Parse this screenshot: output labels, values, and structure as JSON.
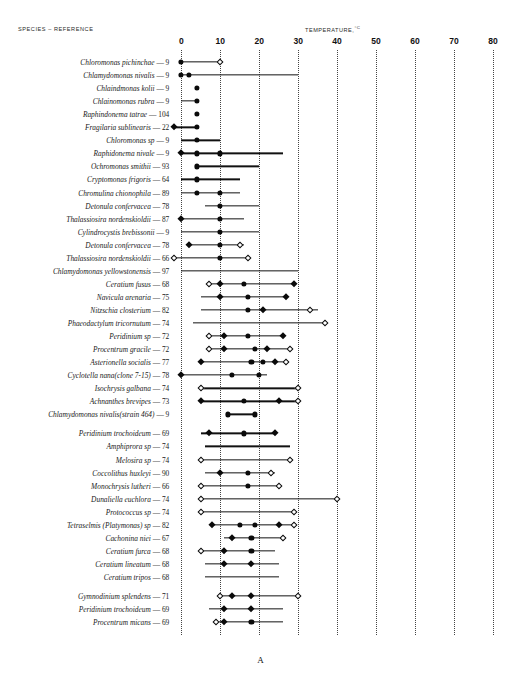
{
  "figure": {
    "species_header": "SPECIES  –  REFERENCE",
    "temperature_header": "TEMPERATURE,",
    "temperature_unit": "°C",
    "panel_letter": "A"
  },
  "chart_data": {
    "type": "range-dot-plot",
    "xlabel": "TEMPERATURE, °C",
    "ylabel": "SPECIES – REFERENCE",
    "xlim": [
      0,
      80
    ],
    "xticks": [
      0,
      10,
      20,
      30,
      40,
      50,
      60,
      70,
      80
    ],
    "xticklabels": [
      "0",
      "10",
      "20",
      "30",
      "40",
      "50",
      "60",
      "70",
      "80"
    ],
    "grid": "vertical dotted at each tick",
    "legend": [
      {
        "symbol": "filled-circle",
        "meaning": "optimum / measured point"
      },
      {
        "symbol": "filled-diamond",
        "meaning": "measured point"
      },
      {
        "symbol": "open-diamond",
        "meaning": "limit point"
      }
    ],
    "marker_types": [
      "filled-circle",
      "filled-diamond",
      "open-diamond"
    ],
    "rows": [
      {
        "species": "Chloromonas pichinchae",
        "reference": "9",
        "range": [
          0.0,
          10.0
        ],
        "markers": [
          {
            "x": 0.0,
            "type": "filled-circle"
          },
          {
            "x": 10.0,
            "type": "open-diamond"
          }
        ]
      },
      {
        "species": "Chlamydomonas nivalis",
        "reference": "9",
        "range": [
          0.0,
          30.0
        ],
        "markers": [
          {
            "x": 0.0,
            "type": "filled-circle"
          },
          {
            "x": 2.0,
            "type": "filled-circle"
          }
        ]
      },
      {
        "species": "Chlaindmonas kolii",
        "reference": "9",
        "range": null,
        "markers": [
          {
            "x": 4.0,
            "type": "filled-circle"
          }
        ]
      },
      {
        "species": "Chlainomonas rubra",
        "reference": "9",
        "range": [
          0.0,
          4.0
        ],
        "markers": [
          {
            "x": 4.0,
            "type": "filled-circle"
          }
        ]
      },
      {
        "species": "Raphindonema tatrae",
        "reference": "104",
        "range": null,
        "markers": [
          {
            "x": 4.0,
            "type": "filled-circle"
          }
        ]
      },
      {
        "species": "Fragilaria sublinearis",
        "reference": "22",
        "range": [
          -1.8,
          4.0
        ],
        "markers": [
          {
            "x": -1.8,
            "type": "filled-diamond"
          },
          {
            "x": 4.0,
            "type": "filled-circle"
          }
        ]
      },
      {
        "species": "Chloromonas sp",
        "reference": "9",
        "range": [
          0.0,
          10.0
        ],
        "markers": [
          {
            "x": 4.0,
            "type": "filled-circle"
          }
        ]
      },
      {
        "species": "Raphidonema nivale",
        "reference": "9",
        "range": [
          0.0,
          26.0
        ],
        "markers": [
          {
            "x": 0.0,
            "type": "filled-diamond"
          },
          {
            "x": 4.0,
            "type": "filled-circle"
          },
          {
            "x": 10.0,
            "type": "filled-circle"
          }
        ]
      },
      {
        "species": "Ochromonas smithii",
        "reference": "93",
        "range": [
          4.0,
          20.0
        ],
        "markers": [
          {
            "x": 4.0,
            "type": "filled-circle"
          }
        ]
      },
      {
        "species": "Cryptomonas frigoris",
        "reference": "64",
        "range": [
          0.0,
          15.0
        ],
        "markers": [
          {
            "x": 4.0,
            "type": "filled-circle"
          }
        ]
      },
      {
        "species": "Chromulina chionophila",
        "reference": "89",
        "range": [
          0.0,
          15.0
        ],
        "markers": [
          {
            "x": 4.0,
            "type": "filled-circle"
          },
          {
            "x": 10.0,
            "type": "filled-circle"
          }
        ]
      },
      {
        "species": "Detonula confervacea",
        "reference": "78",
        "range": [
          6.0,
          20.0
        ],
        "markers": [
          {
            "x": 10.0,
            "type": "filled-circle"
          }
        ]
      },
      {
        "species": "Thalassiosira nordenskioldii",
        "reference": "87",
        "range": [
          0.0,
          16.0
        ],
        "markers": [
          {
            "x": 0.0,
            "type": "filled-diamond"
          },
          {
            "x": 10.0,
            "type": "filled-circle"
          }
        ]
      },
      {
        "species": "Cylindrocystis brebissonii",
        "reference": "9",
        "range": [
          0.0,
          20.0
        ],
        "markers": [
          {
            "x": 10.0,
            "type": "filled-circle"
          }
        ]
      },
      {
        "species": "Detonula confervacea",
        "reference": "78",
        "range": [
          2.0,
          16.0
        ],
        "markers": [
          {
            "x": 2.0,
            "type": "filled-diamond"
          },
          {
            "x": 10.0,
            "type": "filled-circle"
          },
          {
            "x": 15.0,
            "type": "open-diamond"
          }
        ]
      },
      {
        "species": "Thalassiosira nordenskioldii",
        "reference": "66",
        "range": [
          -1.8,
          17.0
        ],
        "markers": [
          {
            "x": -1.8,
            "type": "open-diamond"
          },
          {
            "x": 10.0,
            "type": "filled-circle"
          },
          {
            "x": 17.0,
            "type": "open-diamond"
          }
        ]
      },
      {
        "species": "Chlamydomonas yellowstonensis",
        "reference": "97",
        "range": [
          0.0,
          30.0
        ],
        "markers": []
      },
      {
        "species": "Ceratium fusus",
        "reference": "68",
        "range": [
          7.0,
          29.0
        ],
        "markers": [
          {
            "x": 7.0,
            "type": "open-diamond"
          },
          {
            "x": 10.0,
            "type": "filled-diamond"
          },
          {
            "x": 16.0,
            "type": "filled-circle"
          },
          {
            "x": 29.0,
            "type": "filled-diamond"
          }
        ]
      },
      {
        "species": "Navicula arenaria",
        "reference": "75",
        "range": [
          5.0,
          27.0
        ],
        "markers": [
          {
            "x": 10.0,
            "type": "filled-diamond"
          },
          {
            "x": 17.0,
            "type": "filled-circle"
          },
          {
            "x": 27.0,
            "type": "filled-diamond"
          }
        ]
      },
      {
        "species": "Nitzschia closterium",
        "reference": "82",
        "range": [
          5.0,
          35.0
        ],
        "markers": [
          {
            "x": 17.0,
            "type": "filled-circle"
          },
          {
            "x": 21.0,
            "type": "filled-diamond"
          },
          {
            "x": 33.0,
            "type": "open-diamond"
          }
        ]
      },
      {
        "species": "Phaeodactylum tricornutum",
        "reference": "74",
        "range": [
          3.0,
          37.0
        ],
        "markers": [
          {
            "x": 37.0,
            "type": "open-diamond"
          }
        ]
      },
      {
        "species": "Peridinium sp",
        "reference": "72",
        "range": [
          7.0,
          26.0
        ],
        "markers": [
          {
            "x": 7.0,
            "type": "open-diamond"
          },
          {
            "x": 11.0,
            "type": "filled-diamond"
          },
          {
            "x": 17.0,
            "type": "filled-circle"
          },
          {
            "x": 26.0,
            "type": "filled-diamond"
          }
        ]
      },
      {
        "species": "Procentrum gracile",
        "reference": "72",
        "range": [
          7.0,
          28.0
        ],
        "markers": [
          {
            "x": 7.0,
            "type": "open-diamond"
          },
          {
            "x": 11.0,
            "type": "filled-diamond"
          },
          {
            "x": 19.0,
            "type": "filled-circle"
          },
          {
            "x": 22.0,
            "type": "filled-diamond"
          },
          {
            "x": 28.0,
            "type": "open-diamond"
          }
        ]
      },
      {
        "species": "Asterionella socialis",
        "reference": "77",
        "range": [
          5.0,
          27.0
        ],
        "markers": [
          {
            "x": 5.0,
            "type": "filled-diamond"
          },
          {
            "x": 18.0,
            "type": "filled-circle"
          },
          {
            "x": 21.0,
            "type": "filled-circle"
          },
          {
            "x": 24.0,
            "type": "filled-diamond"
          },
          {
            "x": 27.0,
            "type": "open-diamond"
          }
        ]
      },
      {
        "species": "Cyclotella nana(clone 7-15)",
        "reference": "78",
        "range": [
          0.0,
          22.0
        ],
        "markers": [
          {
            "x": 0.0,
            "type": "filled-diamond"
          },
          {
            "x": 13.0,
            "type": "filled-circle"
          },
          {
            "x": 20.0,
            "type": "filled-circle"
          }
        ]
      },
      {
        "species": "Isochrysis galbana",
        "reference": "74",
        "range": [
          5.0,
          30.0
        ],
        "markers": [
          {
            "x": 5.0,
            "type": "open-diamond"
          },
          {
            "x": 30.0,
            "type": "open-diamond"
          }
        ]
      },
      {
        "species": "Achnanthes brevipes",
        "reference": "73",
        "range": [
          5.0,
          30.0
        ],
        "markers": [
          {
            "x": 5.0,
            "type": "filled-diamond"
          },
          {
            "x": 16.0,
            "type": "filled-circle"
          },
          {
            "x": 25.0,
            "type": "filled-diamond"
          },
          {
            "x": 30.0,
            "type": "open-diamond"
          }
        ]
      },
      {
        "species": "Chlamydomonas nivalis(strain 464)",
        "reference": "9",
        "range": [
          12.0,
          19.0
        ],
        "markers": [
          {
            "x": 12.0,
            "type": "filled-circle"
          },
          {
            "x": 19.0,
            "type": "filled-circle"
          }
        ]
      },
      {
        "species": "Peridinium trochoideum",
        "reference": "69",
        "range": [
          5.0,
          24.0
        ],
        "markers": [
          {
            "x": 7.0,
            "type": "filled-diamond"
          },
          {
            "x": 16.0,
            "type": "filled-circle"
          },
          {
            "x": 24.0,
            "type": "filled-diamond"
          }
        ]
      },
      {
        "species": "Amphiprora sp",
        "reference": "74",
        "range": [
          6.0,
          28.0
        ],
        "markers": []
      },
      {
        "species": "Melosira sp",
        "reference": "74",
        "range": [
          5.0,
          28.0
        ],
        "markers": [
          {
            "x": 5.0,
            "type": "open-diamond"
          },
          {
            "x": 28.0,
            "type": "open-diamond"
          }
        ]
      },
      {
        "species": "Coccolithus huxleyi",
        "reference": "90",
        "range": [
          6.0,
          24.0
        ],
        "markers": [
          {
            "x": 10.0,
            "type": "filled-diamond"
          },
          {
            "x": 17.0,
            "type": "filled-circle"
          },
          {
            "x": 23.0,
            "type": "open-diamond"
          }
        ]
      },
      {
        "species": "Monochrysis lutheri",
        "reference": "66",
        "range": [
          5.0,
          25.0
        ],
        "markers": [
          {
            "x": 5.0,
            "type": "open-diamond"
          },
          {
            "x": 17.0,
            "type": "filled-circle"
          },
          {
            "x": 25.0,
            "type": "open-diamond"
          }
        ]
      },
      {
        "species": "Dunaliella euchlora",
        "reference": "74",
        "range": [
          5.0,
          40.0
        ],
        "markers": [
          {
            "x": 5.0,
            "type": "open-diamond"
          },
          {
            "x": 40.0,
            "type": "open-diamond"
          }
        ]
      },
      {
        "species": "Protococcus sp",
        "reference": "74",
        "range": [
          5.0,
          29.0
        ],
        "markers": [
          {
            "x": 5.0,
            "type": "open-diamond"
          },
          {
            "x": 29.0,
            "type": "open-diamond"
          }
        ]
      },
      {
        "species": "Tetraselmis (Platymonas) sp",
        "reference": "82",
        "range": [
          8.0,
          29.0
        ],
        "markers": [
          {
            "x": 8.0,
            "type": "filled-diamond"
          },
          {
            "x": 15.0,
            "type": "filled-circle"
          },
          {
            "x": 19.0,
            "type": "filled-circle"
          },
          {
            "x": 25.0,
            "type": "filled-diamond"
          },
          {
            "x": 29.0,
            "type": "open-diamond"
          }
        ]
      },
      {
        "species": "Cachonina niei",
        "reference": "67",
        "range": [
          11.0,
          27.0
        ],
        "markers": [
          {
            "x": 13.0,
            "type": "filled-diamond"
          },
          {
            "x": 18.0,
            "type": "filled-circle"
          },
          {
            "x": 26.0,
            "type": "open-diamond"
          }
        ]
      },
      {
        "species": "Ceratium furca",
        "reference": "68",
        "range": [
          5.0,
          24.0
        ],
        "markers": [
          {
            "x": 5.0,
            "type": "open-diamond"
          },
          {
            "x": 11.0,
            "type": "filled-diamond"
          },
          {
            "x": 18.0,
            "type": "filled-circle"
          }
        ]
      },
      {
        "species": "Ceratium lineatum",
        "reference": "68",
        "range": [
          6.0,
          25.0
        ],
        "markers": [
          {
            "x": 11.0,
            "type": "filled-diamond"
          },
          {
            "x": 18.0,
            "type": "filled-diamond"
          }
        ]
      },
      {
        "species": "Ceratium tripos",
        "reference": "68",
        "range": [
          6.0,
          25.0
        ],
        "markers": []
      },
      {
        "species": "Gymnodinium splendens",
        "reference": "71",
        "range": [
          10.0,
          30.0
        ],
        "markers": [
          {
            "x": 10.0,
            "type": "open-diamond"
          },
          {
            "x": 13.0,
            "type": "filled-diamond"
          },
          {
            "x": 18.0,
            "type": "filled-diamond"
          },
          {
            "x": 30.0,
            "type": "open-diamond"
          }
        ]
      },
      {
        "species": "Peridinium trochoideum",
        "reference": "69",
        "range": [
          7.0,
          26.0
        ],
        "markers": [
          {
            "x": 11.0,
            "type": "filled-diamond"
          },
          {
            "x": 18.0,
            "type": "filled-diamond"
          }
        ]
      },
      {
        "species": "Procentrum micans",
        "reference": "69",
        "range": [
          9.0,
          26.0
        ],
        "markers": [
          {
            "x": 9.0,
            "type": "open-diamond"
          },
          {
            "x": 11.0,
            "type": "filled-diamond"
          },
          {
            "x": 18.0,
            "type": "filled-circle"
          }
        ]
      }
    ],
    "row_group_breaks": [
      28,
      40
    ]
  }
}
